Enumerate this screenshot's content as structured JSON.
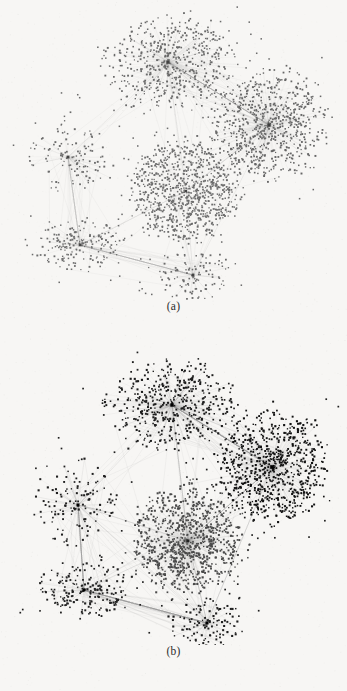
{
  "figure": {
    "background_color": "#f7f6f4",
    "width": 347,
    "height": 691,
    "type": "network-graph-figure",
    "panel_count": 2
  },
  "panels": [
    {
      "id": "a",
      "caption": "(a)",
      "node_color": "#6b6b6b",
      "edge_color": "#9a9a9a",
      "description": "Force-directed layout of a scale-free network with six communities rendered in medium gray",
      "node_size": 1.45,
      "edge_alpha": 0.13,
      "seed": 20240117,
      "clusters": [
        {
          "name": "top-left-hub",
          "cx": 168,
          "cy": 62,
          "rx": 62,
          "ry": 44,
          "nodes": 520,
          "hub": true,
          "hub_spokes": 210,
          "density": 0.55,
          "color": "#6a6a6a",
          "hub_size": 3.2
        },
        {
          "name": "right-hub",
          "cx": 269,
          "cy": 125,
          "rx": 54,
          "ry": 52,
          "nodes": 700,
          "hub": true,
          "hub_spokes": 240,
          "density": 0.7,
          "color": "#666666",
          "hub_size": 3.4
        },
        {
          "name": "center-blob",
          "cx": 186,
          "cy": 191,
          "rx": 52,
          "ry": 48,
          "nodes": 900,
          "hub": false,
          "hub_spokes": 0,
          "density": 0.95,
          "color": "#6d6d6d",
          "hub_size": 2.2
        },
        {
          "name": "left-star",
          "cx": 68,
          "cy": 157,
          "rx": 40,
          "ry": 38,
          "nodes": 120,
          "hub": true,
          "hub_spokes": 70,
          "density": 0.2,
          "color": "#6b6b6b",
          "hub_size": 2.8
        },
        {
          "name": "lower-left-cluster",
          "cx": 80,
          "cy": 245,
          "rx": 42,
          "ry": 26,
          "nodes": 180,
          "hub": true,
          "hub_spokes": 60,
          "density": 0.3,
          "color": "#6e6e6e",
          "hub_size": 2.6
        },
        {
          "name": "bottom-right-star",
          "cx": 193,
          "cy": 275,
          "rx": 36,
          "ry": 24,
          "nodes": 110,
          "hub": true,
          "hub_spokes": 72,
          "density": 0.18,
          "color": "#6b6b6b",
          "hub_size": 2.8
        }
      ],
      "inter_cluster_links": [
        {
          "from": 0,
          "to": 1,
          "count": 46
        },
        {
          "from": 0,
          "to": 2,
          "count": 10
        },
        {
          "from": 1,
          "to": 2,
          "count": 14
        },
        {
          "from": 3,
          "to": 4,
          "count": 26
        },
        {
          "from": 4,
          "to": 5,
          "count": 30
        },
        {
          "from": 3,
          "to": 0,
          "count": 6
        },
        {
          "from": 5,
          "to": 2,
          "count": 10
        },
        {
          "from": 4,
          "to": 2,
          "count": 6
        },
        {
          "from": 5,
          "to": 1,
          "count": 4
        }
      ]
    },
    {
      "id": "b",
      "caption": "(b)",
      "node_color": "#1f1f1f",
      "edge_color": "#8c8c8c",
      "description": "Same network after community detection, drawn with darker nodes and one near-black community",
      "node_size": 1.6,
      "edge_alpha": 0.16,
      "seed": 77311,
      "clusters": [
        {
          "name": "top-left-hub",
          "cx": 172,
          "cy": 60,
          "rx": 62,
          "ry": 44,
          "nodes": 470,
          "hub": true,
          "hub_spokes": 230,
          "density": 0.5,
          "color": "#1c1c1c",
          "hub_size": 3.4
        },
        {
          "name": "right-hub-dark",
          "cx": 272,
          "cy": 122,
          "rx": 52,
          "ry": 54,
          "nodes": 760,
          "hub": true,
          "hub_spokes": 270,
          "density": 0.72,
          "color": "#121212",
          "hub_size": 3.6
        },
        {
          "name": "center-radial-blob",
          "cx": 188,
          "cy": 196,
          "rx": 54,
          "ry": 50,
          "nodes": 880,
          "hub": true,
          "hub_spokes": 300,
          "density": 0.9,
          "color": "#4a4a4a",
          "hub_size": 2.6
        },
        {
          "name": "left-star",
          "cx": 78,
          "cy": 160,
          "rx": 42,
          "ry": 42,
          "nodes": 130,
          "hub": true,
          "hub_spokes": 95,
          "density": 0.18,
          "color": "#1f1f1f",
          "hub_size": 3.0
        },
        {
          "name": "lower-left-cluster",
          "cx": 84,
          "cy": 245,
          "rx": 44,
          "ry": 28,
          "nodes": 200,
          "hub": true,
          "hub_spokes": 80,
          "density": 0.3,
          "color": "#222222",
          "hub_size": 2.8
        },
        {
          "name": "bottom-right-star",
          "cx": 207,
          "cy": 278,
          "rx": 38,
          "ry": 24,
          "nodes": 120,
          "hub": true,
          "hub_spokes": 90,
          "density": 0.16,
          "color": "#1e1e1e",
          "hub_size": 3.0
        }
      ],
      "inter_cluster_links": [
        {
          "from": 0,
          "to": 1,
          "count": 60
        },
        {
          "from": 0,
          "to": 2,
          "count": 14
        },
        {
          "from": 1,
          "to": 2,
          "count": 20
        },
        {
          "from": 3,
          "to": 4,
          "count": 34
        },
        {
          "from": 4,
          "to": 5,
          "count": 46
        },
        {
          "from": 3,
          "to": 0,
          "count": 8
        },
        {
          "from": 3,
          "to": 5,
          "count": 12
        },
        {
          "from": 5,
          "to": 2,
          "count": 14
        },
        {
          "from": 4,
          "to": 2,
          "count": 8
        },
        {
          "from": 5,
          "to": 1,
          "count": 6
        },
        {
          "from": 2,
          "to": 3,
          "count": 6
        }
      ]
    }
  ],
  "chart_data": {
    "type": "scatter",
    "title": "",
    "xlabel": "",
    "ylabel": "",
    "subplots": [
      {
        "label": "(a)",
        "series_name": "network-a",
        "node_count": 2530,
        "community_count": 6,
        "node_color": "#6b6b6b"
      },
      {
        "label": "(b)",
        "series_name": "network-b",
        "node_count": 2560,
        "community_count": 6,
        "node_color": "#1f1f1f"
      }
    ],
    "legend": "none",
    "grid": false
  }
}
